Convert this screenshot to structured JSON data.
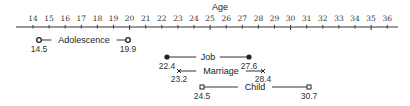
{
  "chart_data": {
    "type": "range",
    "title": "",
    "xlabel": "Age",
    "ylabel": "",
    "xlim": [
      13,
      37
    ],
    "grid": false,
    "legend": null,
    "ticks": [
      14,
      15,
      16,
      17,
      18,
      19,
      20,
      21,
      22,
      23,
      24,
      25,
      26,
      27,
      28,
      29,
      30,
      31,
      32,
      33,
      34,
      35,
      36
    ],
    "major_ticks": [
      20,
      25,
      30,
      35
    ],
    "series": [
      {
        "name": "Adolescence",
        "start": 14.5,
        "end": 19.9,
        "start_label": "14.5",
        "end_label": "19.9",
        "marker": "open-circle"
      },
      {
        "name": "Job",
        "start": 22.4,
        "end": 27.6,
        "start_label": "22.4",
        "end_label": "27.6",
        "marker": "filled-circle"
      },
      {
        "name": "Marriage",
        "start": 23.2,
        "end": 28.4,
        "start_label": "23.2",
        "end_label": "28.4",
        "marker": "x"
      },
      {
        "name": "Child",
        "start": 24.5,
        "end": 30.7,
        "start_label": "24.5",
        "end_label": "30.7",
        "marker": "open-square"
      }
    ]
  },
  "layout": {
    "axis": {
      "y": 27,
      "x_start": 16,
      "x_end": 398,
      "age0": 14,
      "x0": 33,
      "px_per_year": 16.1
    },
    "age_title": {
      "x": 220,
      "y": 10
    },
    "rows": [
      {
        "y": 40,
        "x1": 39,
        "x2": 128,
        "label_x": 84,
        "val_dy": 12
      },
      {
        "y": 57,
        "x1": 167,
        "x2": 249,
        "label_x": 208,
        "val_dy": 12
      },
      {
        "y": 71,
        "x1": 179,
        "x2": 263,
        "label_x": 221,
        "val_dy": 11
      },
      {
        "y": 87,
        "x1": 202,
        "x2": 309,
        "label_x": 255,
        "val_dy": 12
      }
    ]
  },
  "colors": {
    "ink": "#222222",
    "line": "#333333",
    "bg": "#ffffff"
  }
}
